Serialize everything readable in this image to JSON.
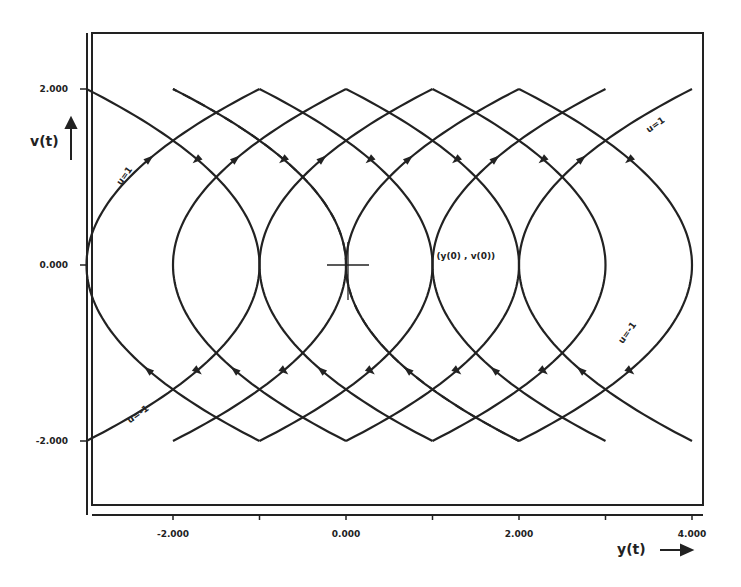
{
  "chart_data": {
    "type": "line",
    "title": "",
    "xlabel": "y(t)",
    "ylabel": "v(t)",
    "xlim": [
      -3,
      4
    ],
    "ylim": [
      -2,
      2
    ],
    "grid": false,
    "x_ticks": [
      {
        "value": -2,
        "label": "-2.000"
      },
      {
        "value": -1,
        "label": ""
      },
      {
        "value": 0,
        "label": "0.000"
      },
      {
        "value": 1,
        "label": ""
      },
      {
        "value": 2,
        "label": "2.000"
      },
      {
        "value": 3,
        "label": ""
      },
      {
        "value": 4,
        "label": "4.000"
      }
    ],
    "y_ticks": [
      {
        "value": 2,
        "label": "2.000"
      },
      {
        "value": 0,
        "label": "0.000"
      },
      {
        "value": -2,
        "label": "-2.000"
      }
    ],
    "series": [
      {
        "name": "u=1 trajectories",
        "equation": "y = v^2/2 + c",
        "c_values": [
          -3,
          -2,
          -1,
          0,
          1,
          2
        ],
        "v_range": [
          -2,
          2
        ],
        "style": "solid"
      },
      {
        "name": "u=-1 trajectories",
        "equation": "y = -v^2/2 + c",
        "c_values": [
          -1,
          0,
          1,
          2,
          3,
          4
        ],
        "v_range": [
          -2,
          2
        ],
        "style": "solid"
      },
      {
        "name": "switching curve",
        "equation": "y = -v|v|/2",
        "v_range": [
          -2,
          2
        ],
        "style": "dashed"
      }
    ],
    "annotations": [
      {
        "text": "u=1",
        "x": -2.6,
        "y": 0.9
      },
      {
        "text": "u=1",
        "x": 3.5,
        "y": 1.5
      },
      {
        "text": "u=-1",
        "x": 3.2,
        "y": -0.9
      },
      {
        "text": "u=-1",
        "x": -2.5,
        "y": -1.8
      },
      {
        "text": "(y(0) , v(0))",
        "x": 1.0,
        "y": 0.1
      },
      {
        "text": "target origin cross",
        "x": 0,
        "y": 0
      }
    ]
  }
}
